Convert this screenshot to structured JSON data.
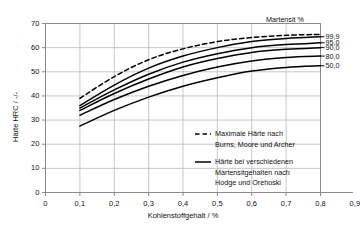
{
  "chart_data": {
    "type": "line",
    "title": "",
    "xlabel": "Kohlenstoffgehalt  / %",
    "ylabel": "Härte HRC  / -/-",
    "xlim": [
      0,
      0.9
    ],
    "ylim": [
      0,
      70
    ],
    "xticks": [
      "0",
      "0,1",
      "0,2",
      "0,3",
      "0,4",
      "0,5",
      "0,6",
      "0,7",
      "0,8",
      "0,9"
    ],
    "xtick_values": [
      0,
      0.1,
      0.2,
      0.3,
      0.4,
      0.5,
      0.6,
      0.7,
      0.8,
      0.9
    ],
    "yticks": [
      "0",
      "10",
      "20",
      "30",
      "40",
      "50",
      "60",
      "70"
    ],
    "ytick_values": [
      0,
      10,
      20,
      30,
      40,
      50,
      60,
      70
    ],
    "grid": true,
    "legend_position": "inside-lower-right",
    "series_group_title": "Martensit %",
    "x": [
      0.1,
      0.2,
      0.3,
      0.4,
      0.5,
      0.6,
      0.7,
      0.8
    ],
    "series": [
      {
        "name": "Maximale Härte",
        "style": "dashed",
        "end_label": "",
        "values": [
          39.0,
          48.0,
          55.0,
          59.5,
          62.5,
          64.2,
          65.1,
          65.5
        ]
      },
      {
        "name": "99,9",
        "style": "solid",
        "end_label": "99,9",
        "values": [
          36.0,
          44.5,
          51.5,
          56.5,
          60.0,
          62.5,
          63.8,
          64.5
        ]
      },
      {
        "name": "95,0",
        "style": "solid",
        "end_label": "95,0",
        "values": [
          35.0,
          42.5,
          49.0,
          54.0,
          57.5,
          60.0,
          61.3,
          62.0
        ]
      },
      {
        "name": "90,0",
        "style": "solid",
        "end_label": "90,0",
        "values": [
          34.0,
          41.0,
          47.0,
          52.0,
          55.5,
          58.0,
          59.3,
          60.0
        ]
      },
      {
        "name": "80,0",
        "style": "solid",
        "end_label": "80,0",
        "values": [
          32.0,
          38.5,
          44.0,
          48.5,
          52.0,
          54.5,
          55.9,
          56.5
        ]
      },
      {
        "name": "50,0",
        "style": "solid",
        "end_label": "50,0",
        "values": [
          27.5,
          34.0,
          39.5,
          44.0,
          47.5,
          50.3,
          51.8,
          52.5
        ]
      }
    ],
    "legend": [
      {
        "style": "dashed",
        "lines": [
          "Maximale Härte nach",
          "Burns, Moore und Archer"
        ]
      },
      {
        "style": "solid",
        "lines": [
          "Härte bei verschiedenen",
          "Martensitgehalten nach",
          "Hodge und Orehoski"
        ]
      }
    ],
    "colors": {
      "line": "#000000",
      "grid": "#b9b9b9",
      "axis": "#8a8a8a",
      "text": "#111111",
      "background": "#ffffff"
    }
  }
}
